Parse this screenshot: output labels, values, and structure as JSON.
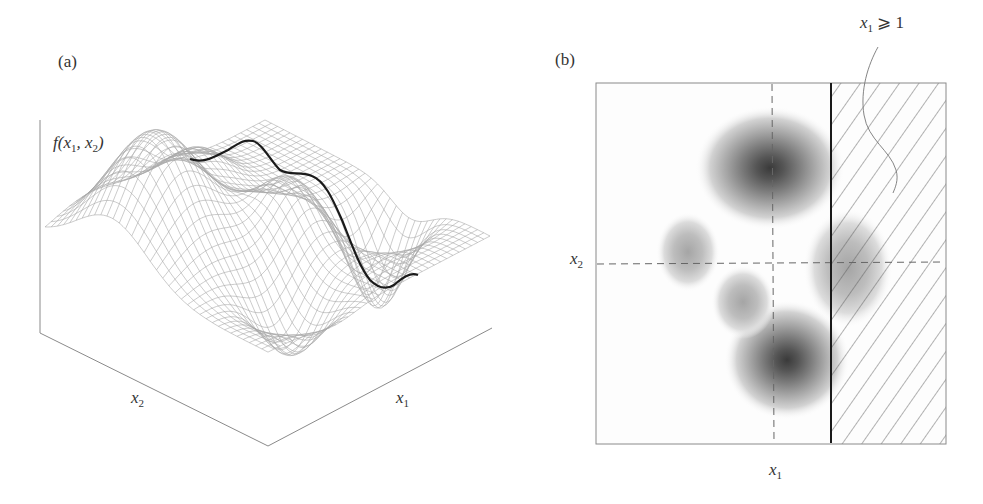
{
  "figure": {
    "panel_a": {
      "tag": "(a)",
      "z_axis_label": {
        "pre": "f(x",
        "s1": "1",
        "mid": ", x",
        "s2": "2",
        "post": ")"
      },
      "x2_label": {
        "base": "x",
        "sub": "2"
      },
      "x1_label": {
        "base": "x",
        "sub": "1"
      },
      "description": "3D wireframe surface of f(x1, x2) with one tall peak, two smaller peaks and two wells; a thick black curve shows the function along the constraint boundary"
    },
    "panel_b": {
      "tag": "(b)",
      "x2_label": {
        "base": "x",
        "sub": "2"
      },
      "x1_label": {
        "base": "x",
        "sub": "1"
      },
      "constraint_label": {
        "base": "x",
        "sub": "1",
        "rel": " ⩾ 1"
      },
      "description": "Contour/density map of f(x1, x2) with dashed crosshair lines, a solid vertical constraint line and hatched infeasible region x1 ≥ 1"
    }
  },
  "chart_data": [
    {
      "type": "surface",
      "title": "(a)",
      "xlabel": "x1",
      "ylabel": "x2",
      "zlabel": "f(x1, x2)",
      "features": [
        {
          "kind": "peak",
          "relative_height": "tallest",
          "position": "back-left"
        },
        {
          "kind": "peak",
          "relative_height": "small",
          "position": "center"
        },
        {
          "kind": "peak",
          "relative_height": "small",
          "position": "right"
        },
        {
          "kind": "well",
          "relative_depth": "moderate",
          "position": "front-left"
        },
        {
          "kind": "well",
          "relative_depth": "deep",
          "position": "front-right"
        }
      ],
      "highlight_curve": "f along constraint boundary x1 = 1"
    },
    {
      "type": "heatmap",
      "title": "(b)",
      "xlabel": "x1",
      "ylabel": "x2",
      "annotation": "x1 ≥ 1 (hatched region)",
      "blobs": [
        {
          "cx": 0.5,
          "cy": 0.25,
          "intensity": "high"
        },
        {
          "cx": 0.55,
          "cy": 0.78,
          "intensity": "high"
        },
        {
          "cx": 0.25,
          "cy": 0.46,
          "intensity": "low"
        },
        {
          "cx": 0.42,
          "cy": 0.61,
          "intensity": "low"
        },
        {
          "cx": 0.72,
          "cy": 0.5,
          "intensity": "low"
        }
      ],
      "dashed_lines": {
        "vertical_x_frac": 0.5,
        "horizontal_y_frac": 0.5
      },
      "constraint_line_x_frac": 0.67,
      "grid": false,
      "legend": null
    }
  ]
}
